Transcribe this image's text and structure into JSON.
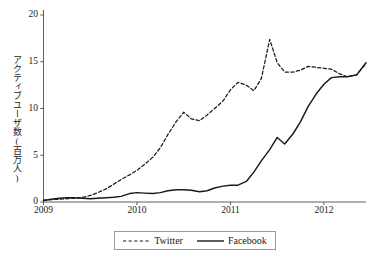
{
  "chart_data": {
    "type": "line",
    "title": "",
    "xlabel": "",
    "ylabel": "アクティブユーザ数(百万人)",
    "xlim": [
      2009.0,
      2012.45
    ],
    "ylim": [
      0,
      20
    ],
    "grid": false,
    "legend_position": "bottom-center",
    "xticks": [
      "2009",
      "2010",
      "2011",
      "2012"
    ],
    "xtick_values": [
      2009,
      2010,
      2011,
      2012
    ],
    "yticks": [
      "0",
      "5",
      "10",
      "15",
      "20"
    ],
    "ytick_values": [
      0,
      5,
      10,
      15,
      20
    ],
    "series": [
      {
        "name": "Twitter",
        "style": "dashed",
        "color": "#1a1a1a",
        "x": [
          2009.0,
          2009.08,
          2009.17,
          2009.25,
          2009.33,
          2009.42,
          2009.5,
          2009.58,
          2009.67,
          2009.75,
          2009.83,
          2009.92,
          2010.0,
          2010.08,
          2010.17,
          2010.25,
          2010.33,
          2010.42,
          2010.5,
          2010.58,
          2010.67,
          2010.75,
          2010.83,
          2010.92,
          2011.0,
          2011.08,
          2011.17,
          2011.25,
          2011.33,
          2011.42,
          2011.5,
          2011.58,
          2011.67,
          2011.75,
          2011.83,
          2011.92,
          2012.0,
          2012.08,
          2012.17,
          2012.25,
          2012.35,
          2012.45
        ],
        "y": [
          0.2,
          0.25,
          0.3,
          0.35,
          0.4,
          0.5,
          0.7,
          1.0,
          1.4,
          1.9,
          2.4,
          2.9,
          3.4,
          4.0,
          4.8,
          5.8,
          7.2,
          8.6,
          9.6,
          8.9,
          8.7,
          9.3,
          10.0,
          10.8,
          12.0,
          12.8,
          12.5,
          11.9,
          13.2,
          17.4,
          14.9,
          13.9,
          13.9,
          14.1,
          14.5,
          14.4,
          14.3,
          14.2,
          13.7,
          13.4,
          13.6,
          14.8
        ]
      },
      {
        "name": "Facebook",
        "style": "solid",
        "color": "#1a1a1a",
        "x": [
          2009.0,
          2009.08,
          2009.17,
          2009.25,
          2009.33,
          2009.42,
          2009.5,
          2009.58,
          2009.67,
          2009.75,
          2009.83,
          2009.92,
          2010.0,
          2010.08,
          2010.17,
          2010.25,
          2010.33,
          2010.42,
          2010.5,
          2010.58,
          2010.67,
          2010.75,
          2010.83,
          2010.92,
          2011.0,
          2011.08,
          2011.17,
          2011.25,
          2011.33,
          2011.42,
          2011.5,
          2011.58,
          2011.67,
          2011.75,
          2011.83,
          2011.92,
          2012.0,
          2012.08,
          2012.17,
          2012.25,
          2012.35,
          2012.45
        ],
        "y": [
          0.15,
          0.3,
          0.4,
          0.45,
          0.45,
          0.4,
          0.35,
          0.4,
          0.45,
          0.5,
          0.6,
          0.9,
          1.0,
          0.95,
          0.9,
          1.0,
          1.2,
          1.3,
          1.3,
          1.25,
          1.1,
          1.2,
          1.5,
          1.7,
          1.8,
          1.8,
          2.2,
          3.2,
          4.4,
          5.6,
          6.9,
          6.2,
          7.3,
          8.6,
          10.2,
          11.6,
          12.6,
          13.3,
          13.4,
          13.4,
          13.6,
          14.9
        ]
      }
    ]
  },
  "axes": {
    "y_title": "アクティブユーザ数(百万人)",
    "y_tick_labels": [
      "20",
      "15",
      "10",
      "5",
      "0"
    ],
    "x_tick_labels": [
      "2009",
      "2010",
      "2011",
      "2012"
    ]
  },
  "legend": {
    "entries": [
      {
        "label": "Twitter",
        "style": "dashed"
      },
      {
        "label": "Facebook",
        "style": "solid"
      }
    ]
  }
}
